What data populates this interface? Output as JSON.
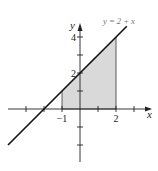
{
  "chart_data": {
    "type": "line",
    "title": "",
    "xlabel": "x",
    "ylabel": "y",
    "xlim": [
      -4,
      4
    ],
    "ylim": [
      -3,
      5
    ],
    "grid": false,
    "series": [
      {
        "name": "y = 2 + x",
        "function": "2 + x",
        "x": [
          -4,
          2.6
        ],
        "y": [
          -2,
          4.6
        ]
      }
    ],
    "shaded_region": {
      "description": "area under y = 2 + x above x-axis",
      "x_from": -1,
      "x_to": 2,
      "color": "#d9d9d9"
    },
    "x_ticks": [
      -3,
      -2,
      -1,
      1,
      2,
      3
    ],
    "y_ticks": [
      -2,
      -1,
      1,
      2,
      3,
      4
    ],
    "x_tick_labels": [
      {
        "value": -1,
        "label": "−1"
      },
      {
        "value": 2,
        "label": "2"
      }
    ],
    "y_tick_labels": [
      {
        "value": 2,
        "label": "2"
      },
      {
        "value": 4,
        "label": "4"
      }
    ],
    "annotation": "y = 2 + x"
  }
}
